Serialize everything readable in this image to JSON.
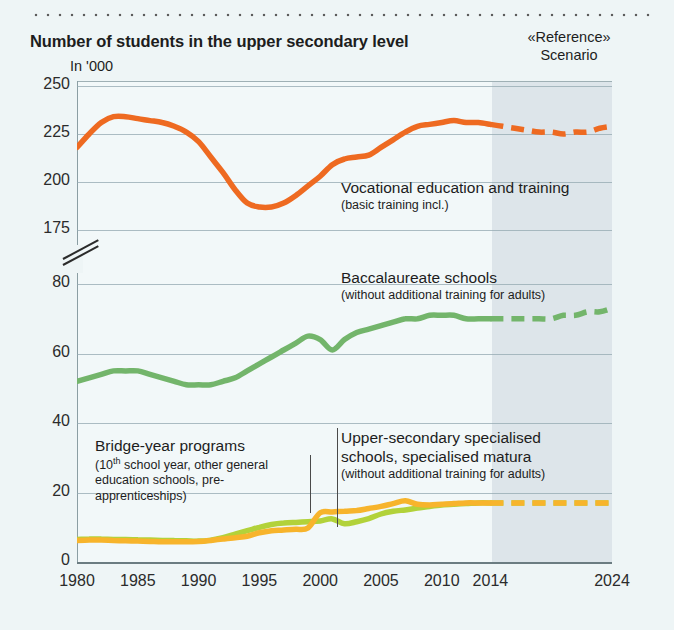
{
  "title": "Number of students in the upper secondary level",
  "unit_label": "In '000",
  "scenario_label_line1": "«Reference»",
  "scenario_label_line2": "Scenario",
  "annotations": {
    "vocational": {
      "main": "Vocational education and training",
      "sub": "(basic training incl.)"
    },
    "baccalaureate": {
      "main": "Baccalaureate schools",
      "sub": "(without additional training for adults)"
    },
    "bridge": {
      "main": "Bridge-year programs",
      "sub_a": "(10",
      "sub_sup": "th",
      "sub_b": " school year, other general education schools, pre-apprenticeships)"
    },
    "specialised": {
      "main_line1": "Upper-secondary specialised",
      "main_line2": "schools, specialised matura",
      "sub": "(without additional training for adults)"
    }
  },
  "colors": {
    "vocational": "#ee6a21",
    "baccalaureate": "#73b56b",
    "bridge": "#b2d23a",
    "specialised": "#f7b42c",
    "background": "#eef5f6",
    "plot_background": "#f2f8f9",
    "scenario_band": "#d9e2e8",
    "gridline": "#93a8b0"
  },
  "chart_data": {
    "type": "line",
    "title": "Number of students in the upper secondary level",
    "xlabel": "",
    "ylabel": "In '000",
    "grid": true,
    "legend": "annotations-inline",
    "x_ticks": [
      1980,
      1985,
      1990,
      1995,
      2000,
      2005,
      2010,
      2014,
      2024
    ],
    "y_ticks": [
      0,
      20,
      40,
      60,
      80,
      175,
      200,
      225,
      250
    ],
    "y_axis_break": {
      "between": [
        80,
        175
      ],
      "note": "broken axis between 80 and 175"
    },
    "xlim": [
      1980,
      2024
    ],
    "forecast_starts": 2014,
    "series": [
      {
        "name": "Vocational education and training (basic training incl.)",
        "color": "#ee6a21",
        "x": [
          1980,
          1981,
          1982,
          1983,
          1984,
          1985,
          1986,
          1987,
          1988,
          1989,
          1990,
          1991,
          1992,
          1993,
          1994,
          1995,
          1996,
          1997,
          1998,
          1999,
          2000,
          2001,
          2002,
          2003,
          2004,
          2005,
          2006,
          2007,
          2008,
          2009,
          2010,
          2011,
          2012,
          2013,
          2014
        ],
        "values": [
          218,
          225,
          231,
          234,
          234,
          233,
          232,
          231,
          229,
          226,
          221,
          213,
          205,
          196,
          189,
          187,
          187,
          189,
          193,
          198,
          203,
          209,
          212,
          213,
          214,
          218,
          222,
          226,
          229,
          230,
          231,
          232,
          231,
          231,
          230
        ],
        "forecast_x": [
          2014,
          2015,
          2016,
          2017,
          2018,
          2019,
          2020,
          2021,
          2022,
          2023,
          2024
        ],
        "forecast_values": [
          230,
          229,
          228,
          227,
          226,
          226,
          225,
          226,
          226,
          228,
          229
        ]
      },
      {
        "name": "Baccalaureate schools (without additional training for adults)",
        "color": "#73b56b",
        "x": [
          1980,
          1981,
          1982,
          1983,
          1984,
          1985,
          1986,
          1987,
          1988,
          1989,
          1990,
          1991,
          1992,
          1993,
          1994,
          1995,
          1996,
          1997,
          1998,
          1999,
          2000,
          2001,
          2002,
          2003,
          2004,
          2005,
          2006,
          2007,
          2008,
          2009,
          2010,
          2011,
          2012,
          2013,
          2014
        ],
        "values": [
          52,
          53,
          54,
          55,
          55,
          55,
          54,
          53,
          52,
          51,
          51,
          51,
          52,
          53,
          55,
          57,
          59,
          61,
          63,
          65,
          64,
          61,
          64,
          66,
          67,
          68,
          69,
          70,
          70,
          71,
          71,
          71,
          70,
          70,
          70
        ],
        "forecast_x": [
          2014,
          2015,
          2016,
          2017,
          2018,
          2019,
          2020,
          2021,
          2022,
          2023,
          2024
        ],
        "forecast_values": [
          70,
          70,
          70,
          70,
          70,
          70,
          71,
          71,
          72,
          72,
          73
        ]
      },
      {
        "name": "Bridge-year programs (10th school year, other general education schools, pre-apprenticeships)",
        "color": "#b2d23a",
        "x": [
          1980,
          1981,
          1982,
          1983,
          1984,
          1985,
          1986,
          1987,
          1988,
          1989,
          1990,
          1991,
          1992,
          1993,
          1994,
          1995,
          1996,
          1997,
          1998,
          1999,
          2000,
          2001,
          2002,
          2003,
          2004,
          2005,
          2006,
          2007,
          2008,
          2009,
          2010,
          2011,
          2012,
          2013,
          2014
        ],
        "values": [
          6.5,
          6.6,
          6.6,
          6.5,
          6.5,
          6.4,
          6.3,
          6.2,
          6.2,
          6.1,
          6.0,
          6.3,
          7.0,
          8.0,
          9.0,
          10.0,
          10.8,
          11.2,
          11.4,
          11.6,
          11.8,
          12.4,
          11.0,
          11.6,
          12.5,
          13.8,
          14.6,
          15.0,
          15.5,
          16.0,
          16.4,
          16.6,
          16.8,
          17.0,
          17.0
        ],
        "forecast_x": [
          2014,
          2015,
          2016,
          2017,
          2018,
          2019,
          2020,
          2021,
          2022,
          2023,
          2024
        ],
        "forecast_values": [
          17.0,
          17.0,
          17.0,
          17.0,
          17.0,
          17.0,
          17.0,
          17.0,
          17.0,
          17.0,
          17.0
        ]
      },
      {
        "name": "Upper-secondary specialised schools, specialised matura (without additional training for adults)",
        "color": "#f7b42c",
        "x": [
          1980,
          1981,
          1982,
          1983,
          1984,
          1985,
          1986,
          1987,
          1988,
          1989,
          1990,
          1991,
          1992,
          1993,
          1994,
          1995,
          1996,
          1997,
          1998,
          1999,
          2000,
          2001,
          2002,
          2003,
          2004,
          2005,
          2006,
          2007,
          2008,
          2009,
          2010,
          2011,
          2012,
          2013,
          2014
        ],
        "values": [
          6.2,
          6.3,
          6.3,
          6.2,
          6.1,
          6.0,
          5.9,
          5.8,
          5.8,
          5.8,
          5.9,
          6.2,
          6.6,
          7.0,
          7.4,
          8.4,
          9.0,
          9.2,
          9.4,
          9.8,
          14.2,
          14.4,
          14.6,
          14.8,
          15.4,
          16.0,
          16.8,
          17.6,
          16.6,
          16.4,
          16.6,
          16.8,
          17.0,
          17.0,
          17.0
        ],
        "forecast_x": [
          2014,
          2015,
          2016,
          2017,
          2018,
          2019,
          2020,
          2021,
          2022,
          2023,
          2024
        ],
        "forecast_values": [
          17.0,
          17.0,
          17.0,
          17.0,
          17.0,
          17.0,
          17.0,
          17.0,
          17.0,
          17.0,
          17.0
        ]
      }
    ]
  }
}
